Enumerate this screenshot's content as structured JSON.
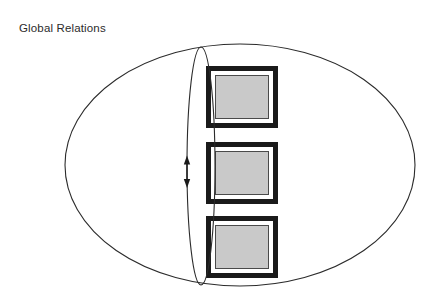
{
  "figure": {
    "title": "Global Relations",
    "background_color": "#ffffff",
    "width": 434,
    "height": 301
  },
  "diagram": {
    "type": "conceptual-venn-stack",
    "outer_boundary": {
      "name": "global-scope-ellipse",
      "shape": "ellipse",
      "cx": 240,
      "cy": 165,
      "rx": 175,
      "ry": 121,
      "stroke": "#2b2b2b",
      "stroke_width": 1.1,
      "fill": "none"
    },
    "inner_boundary": {
      "name": "relation-axis-ellipse",
      "shape": "ellipse",
      "cx": 201,
      "cy": 166,
      "rx": 14,
      "ry": 119,
      "stroke": "#2b2b2b",
      "stroke_width": 1.1,
      "fill": "none"
    },
    "arrow": {
      "name": "bidirectional-relation-arrow",
      "direction": "vertical-double-headed",
      "x": 187,
      "y_top": 157,
      "y_bottom": 186,
      "stroke": "#1a1a1a",
      "stroke_width": 1.4
    },
    "node_frame": {
      "outer_stroke": "#1a1a1a",
      "outer_stroke_width": 5,
      "gap_fill": "#ffffff",
      "inner_fill": "#c9c9c9",
      "inner_stroke": "#4a4a4a",
      "inner_stroke_width": 1
    },
    "nodes": [
      {
        "name": "framed-node-1",
        "label": "",
        "x": 206,
        "y": 66,
        "width": 72,
        "height": 62
      },
      {
        "name": "framed-node-2",
        "label": "",
        "x": 206,
        "y": 142,
        "width": 72,
        "height": 62
      },
      {
        "name": "framed-node-3",
        "label": "",
        "x": 206,
        "y": 216,
        "width": 72,
        "height": 62
      }
    ]
  }
}
